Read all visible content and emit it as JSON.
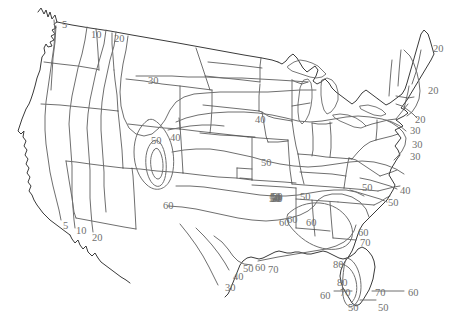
{
  "figure": {
    "kind": "contour-map",
    "region": "Continental United States",
    "background_color": "#ffffff",
    "boundary_color": "#4a4a4a",
    "contour_color": "#6f6f6f",
    "label_color": "#70706e"
  },
  "chart_data": {
    "type": "contour-map",
    "title": "",
    "subtitle": "",
    "xlabel": "",
    "ylabel": "",
    "grid": false,
    "legend": "none",
    "contour_levels": [
      5,
      10,
      20,
      30,
      40,
      50,
      60,
      70,
      80
    ],
    "level_range": [
      5,
      80
    ],
    "gradient_direction": "values increase from northwest/west toward the southeast",
    "annotations": [
      {
        "id": "a01",
        "text": "5",
        "x": 62,
        "y": 20,
        "region": "Pacific Northwest coast"
      },
      {
        "id": "a02",
        "text": "10",
        "x": 91,
        "y": 30,
        "region": "northern Idaho"
      },
      {
        "id": "a03",
        "text": "20",
        "x": 114,
        "y": 34,
        "region": "Idaho/Montana border"
      },
      {
        "id": "a04",
        "text": "30",
        "x": 148,
        "y": 76,
        "region": "northern Plains"
      },
      {
        "id": "a05",
        "text": "50",
        "x": 151,
        "y": 136,
        "region": "Utah"
      },
      {
        "id": "a06",
        "text": "40",
        "x": 170,
        "y": 133,
        "region": "Colorado"
      },
      {
        "id": "a07",
        "text": "60",
        "x": 163,
        "y": 201,
        "region": "Arizona / New Mexico"
      },
      {
        "id": "a08",
        "text": "40",
        "x": 255,
        "y": 115,
        "region": "upper Midwest"
      },
      {
        "id": "a09",
        "text": "50",
        "x": 261,
        "y": 158,
        "region": "central Plains"
      },
      {
        "id": "a10",
        "text": "50",
        "x": 272,
        "y": 192,
        "region": "Oklahoma / Arkansas"
      },
      {
        "id": "a11",
        "text": "60",
        "x": 287,
        "y": 215,
        "region": "Texas / Louisiana"
      },
      {
        "id": "a12",
        "text": "30",
        "x": 225,
        "y": 283,
        "region": "south Texas"
      },
      {
        "id": "a13",
        "text": "40",
        "x": 233,
        "y": 272,
        "region": "south Texas coast"
      },
      {
        "id": "a14",
        "text": "50",
        "x": 243,
        "y": 264,
        "region": "Texas Gulf coast"
      },
      {
        "id": "a15",
        "text": "60",
        "x": 255,
        "y": 263,
        "region": "Texas Gulf coast"
      },
      {
        "id": "a16",
        "text": "70",
        "x": 268,
        "y": 265,
        "region": "Louisiana coast"
      },
      {
        "id": "a17",
        "text": "50",
        "x": 271,
        "y": 194,
        "region": "Arkansas"
      },
      {
        "id": "a18",
        "text": "50",
        "x": 272,
        "y": 194,
        "region": "Mississippi valley"
      },
      {
        "id": "a19",
        "text": "50",
        "x": 271,
        "y": 194,
        "region": "duplicate-guard"
      },
      {
        "id": "a20",
        "text": "50",
        "x": 270,
        "y": 194,
        "region": "duplicate-guard"
      },
      {
        "id": "a21",
        "text": "50",
        "x": 269,
        "y": 194,
        "region": "duplicate-guard"
      },
      {
        "id": "a22",
        "text": "50",
        "x": 270,
        "y": 193,
        "region": "duplicate-guard"
      },
      {
        "id": "a23",
        "text": "60",
        "x": 279,
        "y": 218,
        "region": "Mississippi"
      },
      {
        "id": "a24",
        "text": "50",
        "x": 270,
        "y": 192,
        "region": "duplicate-guard"
      },
      {
        "id": "a25",
        "text": "20",
        "x": 433,
        "y": 44,
        "region": "northern Maine"
      },
      {
        "id": "a26",
        "text": "20",
        "x": 428,
        "y": 86,
        "region": "Maine coast"
      },
      {
        "id": "a27",
        "text": "20",
        "x": 415,
        "y": 115,
        "region": "southern New England"
      },
      {
        "id": "a28",
        "text": "30",
        "x": 410,
        "y": 126,
        "region": "Long Island / NJ"
      },
      {
        "id": "a29",
        "text": "30",
        "x": 412,
        "y": 140,
        "region": "Delmarva"
      },
      {
        "id": "a30",
        "text": "30",
        "x": 410,
        "y": 152,
        "region": "Virginia coast"
      },
      {
        "id": "a31",
        "text": "50",
        "x": 362,
        "y": 183,
        "region": "North Carolina"
      },
      {
        "id": "a32",
        "text": "40",
        "x": 400,
        "y": 186,
        "region": "Outer Banks"
      },
      {
        "id": "a33",
        "text": "50",
        "x": 388,
        "y": 198,
        "region": "Carolina coast"
      },
      {
        "id": "a34",
        "text": "60",
        "x": 358,
        "y": 228,
        "region": "Georgia"
      },
      {
        "id": "a35",
        "text": "70",
        "x": 360,
        "y": 238,
        "region": "Georgia coast"
      },
      {
        "id": "a36",
        "text": "50",
        "x": 300,
        "y": 192,
        "region": "Tennessee"
      },
      {
        "id": "a37",
        "text": "60",
        "x": 306,
        "y": 218,
        "region": "Alabama"
      },
      {
        "id": "a38",
        "text": "80",
        "x": 333,
        "y": 260,
        "region": "north Florida"
      },
      {
        "id": "a39",
        "text": "80",
        "x": 337,
        "y": 278,
        "region": "central Florida"
      },
      {
        "id": "a40",
        "text": "60",
        "x": 320,
        "y": 291,
        "region": "Gulf west of Florida"
      },
      {
        "id": "a41",
        "text": "70",
        "x": 340,
        "y": 288,
        "region": "southwest Florida"
      },
      {
        "id": "a42",
        "text": "70",
        "x": 375,
        "y": 288,
        "region": "southeast Florida"
      },
      {
        "id": "a43",
        "text": "60",
        "x": 408,
        "y": 288,
        "region": "Atlantic east of Florida"
      },
      {
        "id": "a44",
        "text": "50",
        "x": 348,
        "y": 303,
        "region": "south Florida"
      },
      {
        "id": "a45",
        "text": "50",
        "x": 378,
        "y": 303,
        "region": "Florida Keys"
      },
      {
        "id": "a46",
        "text": "5",
        "x": 63,
        "y": 221,
        "region": "southern California"
      },
      {
        "id": "a47",
        "text": "10",
        "x": 76,
        "y": 226,
        "region": "southern California"
      },
      {
        "id": "a48",
        "text": "20",
        "x": 92,
        "y": 233,
        "region": "Arizona border"
      }
    ]
  }
}
